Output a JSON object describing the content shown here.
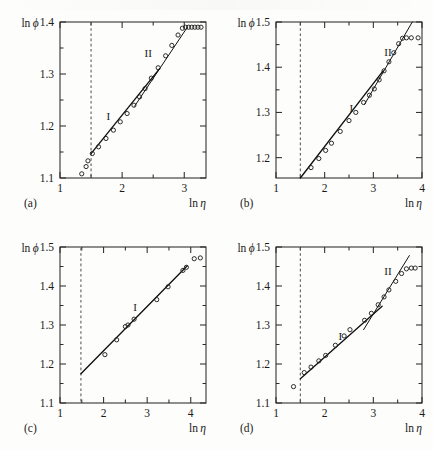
{
  "figure": {
    "layout": "2x2 grid of scatter plots with linear fits",
    "axis_label_y": "ln ϕ",
    "axis_label_x": "ln η",
    "ink_color": "#1a1a1a",
    "background_color": "#fdfdfc"
  },
  "chart_data": [
    {
      "type": "scatter",
      "panel_label": "(a)",
      "title": "",
      "xlabel": "ln η",
      "ylabel": "ln ϕ",
      "xlim": [
        1.0,
        3.35
      ],
      "ylim": [
        1.1,
        1.4
      ],
      "xticks": [
        1,
        2,
        3
      ],
      "xtick_labels": [
        "1",
        "2",
        "3"
      ],
      "yticks": [
        1.1,
        1.2,
        1.3,
        1.4
      ],
      "ytick_labels": [
        "1.1",
        "1.2",
        "1.3",
        "1.4"
      ],
      "minor_xticks": [
        1.5,
        2.5
      ],
      "minor_yticks": [
        1.15,
        1.25,
        1.35
      ],
      "grid": false,
      "legend": "none",
      "annotations": [
        {
          "text": "I",
          "x": 1.78,
          "y": 1.212
        },
        {
          "text": "II",
          "x": 2.42,
          "y": 1.333
        }
      ],
      "reference_line": {
        "type": "vertical-dashed",
        "x": 1.5
      },
      "x": [
        1.35,
        1.42,
        1.45,
        1.52,
        1.62,
        1.74,
        1.86,
        1.97,
        2.08,
        2.19,
        2.28,
        2.37,
        2.47,
        2.58,
        2.7,
        2.8,
        2.9,
        2.97,
        3.02,
        3.07,
        3.12,
        3.17,
        3.22,
        3.27
      ],
      "y": [
        1.108,
        1.122,
        1.133,
        1.147,
        1.16,
        1.176,
        1.192,
        1.208,
        1.224,
        1.24,
        1.256,
        1.272,
        1.292,
        1.312,
        1.335,
        1.355,
        1.375,
        1.388,
        1.39,
        1.39,
        1.39,
        1.39,
        1.39,
        1.39
      ],
      "fits": [
        {
          "name": "I",
          "x0": 1.5,
          "y0": 1.147,
          "x1": 2.6,
          "y1": 1.31
        },
        {
          "name": "II",
          "x0": 2.2,
          "y0": 1.238,
          "x1": 3.05,
          "y1": 1.39
        }
      ]
    },
    {
      "type": "scatter",
      "panel_label": "(b)",
      "title": "",
      "xlabel": "ln η",
      "ylabel": "ln ϕ",
      "xlim": [
        1.0,
        4.0
      ],
      "ylim": [
        1.155,
        1.5
      ],
      "xticks": [
        1,
        2,
        3,
        4
      ],
      "xtick_labels": [
        "1",
        "2",
        "3",
        "4"
      ],
      "yticks": [
        1.2,
        1.3,
        1.4,
        1.5
      ],
      "ytick_labels": [
        "1.2",
        "1.3",
        "1.4",
        "1.5"
      ],
      "minor_xticks": [
        1.5,
        2.5,
        3.5
      ],
      "minor_yticks": [
        1.25,
        1.35,
        1.45
      ],
      "grid": false,
      "legend": "none",
      "annotations": [
        {
          "text": "I",
          "x": 2.55,
          "y": 1.3
        },
        {
          "text": "II",
          "x": 3.3,
          "y": 1.425
        }
      ],
      "reference_line": {
        "type": "vertical-dashed",
        "x": 1.5
      },
      "x": [
        1.72,
        1.88,
        2.02,
        2.14,
        2.32,
        2.5,
        2.64,
        2.8,
        2.92,
        3.02,
        3.12,
        3.22,
        3.32,
        3.42,
        3.52,
        3.6,
        3.68,
        3.78,
        3.92
      ],
      "y": [
        1.178,
        1.198,
        1.216,
        1.232,
        1.258,
        1.282,
        1.3,
        1.322,
        1.338,
        1.352,
        1.372,
        1.392,
        1.412,
        1.432,
        1.452,
        1.464,
        1.465,
        1.465,
        1.465
      ],
      "fits": [
        {
          "name": "I",
          "x0": 1.5,
          "y0": 1.155,
          "x1": 3.2,
          "y1": 1.392
        },
        {
          "name": "II",
          "x0": 2.82,
          "y0": 1.318,
          "x1": 3.8,
          "y1": 1.5
        }
      ]
    },
    {
      "type": "scatter",
      "panel_label": "(c)",
      "title": "",
      "xlabel": "ln η",
      "ylabel": "ln ϕ",
      "xlim": [
        1.0,
        4.35
      ],
      "ylim": [
        1.1,
        1.5
      ],
      "xticks": [
        1,
        2,
        3,
        4
      ],
      "xtick_labels": [
        "1",
        "2",
        "3",
        "4"
      ],
      "yticks": [
        1.1,
        1.2,
        1.3,
        1.4,
        1.5
      ],
      "ytick_labels": [
        "1.1",
        "1.2",
        "1.3",
        "1.4",
        "1.5"
      ],
      "minor_xticks": [
        1.5,
        2.5,
        3.5
      ],
      "minor_yticks": [
        1.15,
        1.25,
        1.35,
        1.45
      ],
      "grid": false,
      "legend": "none",
      "annotations": [
        {
          "text": "I",
          "x": 2.72,
          "y": 1.335
        }
      ],
      "reference_line": {
        "type": "vertical-dashed",
        "x": 1.48
      },
      "x": [
        2.03,
        2.3,
        2.5,
        2.56,
        2.7,
        3.22,
        3.48,
        3.82,
        3.9,
        4.08,
        4.22
      ],
      "y": [
        1.224,
        1.262,
        1.296,
        1.3,
        1.315,
        1.365,
        1.398,
        1.44,
        1.448,
        1.47,
        1.472
      ],
      "fits": [
        {
          "name": "I",
          "x0": 1.48,
          "y0": 1.175,
          "x1": 3.92,
          "y1": 1.452
        }
      ]
    },
    {
      "type": "scatter",
      "panel_label": "(d)",
      "title": "",
      "xlabel": "ln η",
      "ylabel": "ln ϕ",
      "xlim": [
        1.0,
        4.0
      ],
      "ylim": [
        1.1,
        1.5
      ],
      "xticks": [
        1,
        2,
        3,
        4
      ],
      "xtick_labels": [
        "1",
        "2",
        "3",
        "4"
      ],
      "yticks": [
        1.1,
        1.2,
        1.3,
        1.4,
        1.5
      ],
      "ytick_labels": [
        "1.1",
        "1.2",
        "1.3",
        "1.4",
        "1.5"
      ],
      "minor_xticks": [
        1.5,
        2.5,
        3.5
      ],
      "minor_yticks": [
        1.15,
        1.25,
        1.35,
        1.45
      ],
      "grid": false,
      "legend": "none",
      "annotations": [
        {
          "text": "I",
          "x": 2.32,
          "y": 1.262
        },
        {
          "text": "II",
          "x": 3.3,
          "y": 1.428
        }
      ],
      "reference_line": {
        "type": "vertical-dashed",
        "x": 1.5
      },
      "x": [
        1.36,
        1.58,
        1.72,
        1.88,
        2.02,
        2.22,
        2.4,
        2.52,
        2.82,
        2.96,
        3.1,
        3.22,
        3.32,
        3.46,
        3.58,
        3.68,
        3.78,
        3.86
      ],
      "y": [
        1.142,
        1.178,
        1.192,
        1.208,
        1.222,
        1.248,
        1.272,
        1.288,
        1.312,
        1.33,
        1.352,
        1.372,
        1.39,
        1.412,
        1.432,
        1.444,
        1.446,
        1.446
      ],
      "fits": [
        {
          "name": "I",
          "x0": 1.5,
          "y0": 1.162,
          "x1": 3.18,
          "y1": 1.348
        },
        {
          "name": "II",
          "x0": 2.8,
          "y0": 1.288,
          "x1": 3.74,
          "y1": 1.478
        }
      ]
    }
  ]
}
